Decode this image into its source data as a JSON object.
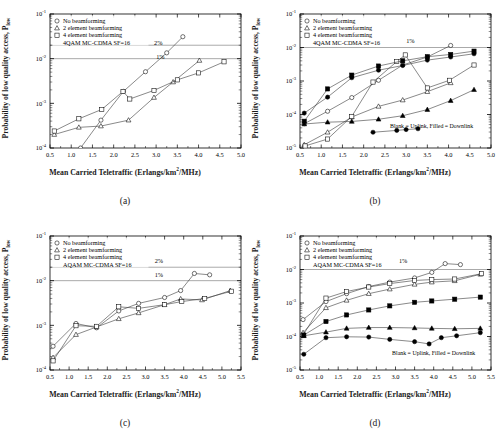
{
  "figure": {
    "panels": [
      {
        "id": "a",
        "caption": "(a)",
        "legend": {
          "items": [
            {
              "marker": "circle-open",
              "label": "No beamforming"
            },
            {
              "marker": "triangle-open",
              "label": "2 element beamforming"
            },
            {
              "marker": "square-open",
              "label": "4 element beamforming"
            }
          ],
          "note": "4QAM MC-CDMA SF=16"
        },
        "annotations": [
          {
            "text": "2%",
            "x": 3.05,
            "y": 0.02
          },
          {
            "text": "1%",
            "x": 3.1,
            "y": 0.01
          }
        ],
        "chart_data": {
          "type": "line",
          "title": "",
          "xlabel": "Mean Carried Teletraffic (Erlangs/km2/MHz)",
          "ylabel": "Probability of low quality access, Plow",
          "xlim": [
            0.5,
            5.0
          ],
          "ylim": [
            0.0001,
            0.1
          ],
          "yscale": "log",
          "xticks": [
            0.5,
            1.0,
            1.5,
            2.0,
            2.5,
            3.0,
            3.5,
            4.0,
            4.5,
            5.0
          ],
          "yticks": [
            0.0001,
            0.001,
            0.01,
            0.1
          ],
          "ytick_labels": [
            "10-4",
            "10-3",
            "10-2",
            "10-1"
          ],
          "grid": false,
          "hlines": [
            {
              "y": 0.02,
              "label": "2%"
            },
            {
              "y": 0.01,
              "label": "1%"
            }
          ],
          "series": [
            {
              "name": "No beamforming",
              "marker": "circle-open",
              "x": [
                1.22,
                1.7,
                2.23,
                2.75,
                3.25,
                3.63
              ],
              "y": [
                0.0001,
                0.00042,
                0.00185,
                0.0051,
                0.0135,
                0.031
              ]
            },
            {
              "name": "2 element beamforming",
              "marker": "triangle-open",
              "x": [
                0.6,
                1.18,
                1.7,
                2.35,
                2.95,
                3.4,
                4.02
              ],
              "y": [
                0.0002,
                0.00029,
                0.00031,
                0.00042,
                0.00135,
                0.003,
                0.0091
              ]
            },
            {
              "name": "4 element beamforming",
              "marker": "square-open",
              "x": [
                0.6,
                1.18,
                1.72,
                2.22,
                2.38,
                2.95,
                3.5,
                4.0,
                4.6
              ],
              "y": [
                0.00024,
                0.00045,
                0.00073,
                0.00185,
                0.00125,
                0.00195,
                0.00335,
                0.0048,
                0.0085
              ]
            }
          ]
        }
      },
      {
        "id": "b",
        "caption": "(b)",
        "legend": {
          "items": [
            {
              "marker": "circle-open",
              "label": "No beamforming"
            },
            {
              "marker": "triangle-open",
              "label": "2 element beamforming"
            },
            {
              "marker": "square-open",
              "label": "4 element beamforming"
            }
          ],
          "note": "4QAM MC-CDMA SF=16"
        },
        "annotations": [
          {
            "text": "1%",
            "x": 3.1,
            "y": 0.014
          },
          {
            "text": "Blank = Uplink, Filled = Downlink",
            "x": 3.6,
            "y": 4e-05
          }
        ],
        "chart_data": {
          "type": "line",
          "title": "",
          "xlabel": "Mean Carried Teletraffic (Erlangs/km2/MHz)",
          "ylabel": "Probability of low quality access, Plow",
          "xlim": [
            0.5,
            5.0
          ],
          "ylim": [
            1e-05,
            0.1
          ],
          "yscale": "log",
          "xticks": [
            0.5,
            1.0,
            1.5,
            2.0,
            2.5,
            3.0,
            3.5,
            4.0,
            4.5,
            5.0
          ],
          "yticks": [
            1e-05,
            0.0001,
            0.001,
            0.01,
            0.1
          ],
          "ytick_labels": [
            "10-5",
            "10-4",
            "10-3",
            "10-2",
            "10-1"
          ],
          "grid": false,
          "hlines": [
            {
              "y": 0.01,
              "label": "1%"
            }
          ],
          "series": [
            {
              "name": "No beamforming uplink",
              "marker": "circle-open",
              "x": [
                0.6,
                1.15,
                1.72,
                2.35,
                2.92,
                3.5,
                4.05
              ],
              "y": [
                5.3e-05,
                0.000125,
                0.00032,
                0.00105,
                0.003,
                0.0052,
                0.0115
              ]
            },
            {
              "name": "No beamforming downlink",
              "marker": "circle-filled",
              "x": [
                0.6,
                1.15,
                1.72,
                2.35,
                2.92,
                3.5,
                4.05,
                4.6
              ],
              "y": [
                0.00011,
                0.00033,
                0.00125,
                0.0021,
                0.0029,
                0.0042,
                0.0052,
                0.0065
              ]
            },
            {
              "name": "2 element uplink",
              "marker": "triangle-open",
              "x": [
                0.6,
                1.15,
                1.72,
                2.35,
                2.92,
                3.5,
                4.05
              ],
              "y": [
                1.25e-05,
                2.95e-05,
                8.4e-05,
                0.000175,
                0.00027,
                0.00048,
                0.00088
              ]
            },
            {
              "name": "2 element downlink",
              "marker": "triangle-filled",
              "x": [
                0.6,
                1.15,
                1.72,
                2.35,
                2.92,
                3.5,
                4.05,
                4.6
              ],
              "y": [
                5.2e-05,
                5.9e-05,
                6.2e-05,
                7.2e-05,
                9.2e-05,
                0.00014,
                0.00026,
                0.00055
              ]
            },
            {
              "name": "4 element uplink",
              "marker": "square-open",
              "x": [
                0.62,
                1.15,
                1.72,
                2.22,
                2.78,
                2.98,
                3.5,
                4.02,
                4.6
              ],
              "y": [
                1.15e-05,
                1.85e-05,
                8.8e-05,
                0.00093,
                0.0038,
                0.006,
                0.00062,
                0.00105,
                0.003
              ]
            },
            {
              "name": "4 element downlink",
              "marker": "square-filled",
              "x": [
                0.6,
                1.15,
                1.72,
                2.35,
                2.92,
                3.5,
                4.05,
                4.6
              ],
              "y": [
                6.3e-05,
                0.00058,
                0.0015,
                0.0028,
                0.004,
                0.0053,
                0.0062,
                0.0078
              ]
            },
            {
              "name": "low downlink",
              "marker": "circle-filled",
              "x": [
                2.22,
                2.78,
                3.0,
                3.28
              ],
              "y": [
                2.95e-05,
                3.35e-05,
                3.55e-05,
                3.75e-05
              ]
            }
          ]
        }
      },
      {
        "id": "c",
        "caption": "(c)",
        "legend": {
          "items": [
            {
              "marker": "circle-open",
              "label": "No beamforming"
            },
            {
              "marker": "triangle-open",
              "label": "2 element beamforming"
            },
            {
              "marker": "square-open",
              "label": "4 element beamforming"
            }
          ],
          "note": "AQAM MC-CDMA SF=16"
        },
        "annotations": [
          {
            "text": "2%",
            "x": 3.35,
            "y": 0.025
          },
          {
            "text": "1%",
            "x": 3.35,
            "y": 0.012
          }
        ],
        "chart_data": {
          "type": "line",
          "title": "",
          "xlabel": "Mean Carried Teletraffic (Erlangs/km2/MHz)",
          "ylabel": "Probability of low quality access, Plow",
          "xlim": [
            0.5,
            5.5
          ],
          "ylim": [
            0.0001,
            0.1
          ],
          "yscale": "log",
          "xticks": [
            0.5,
            1.0,
            1.5,
            2.0,
            2.5,
            3.0,
            3.5,
            4.0,
            4.5,
            5.0,
            5.5
          ],
          "yticks": [
            0.0001,
            0.001,
            0.01,
            0.1
          ],
          "ytick_labels": [
            "10-4",
            "10-3",
            "10-2",
            "10-1"
          ],
          "grid": false,
          "hlines": [
            {
              "y": 0.02,
              "label": "2%"
            },
            {
              "y": 0.01,
              "label": "1%"
            }
          ],
          "series": [
            {
              "name": "No beamforming",
              "marker": "circle-open",
              "x": [
                0.58,
                1.18,
                1.72,
                2.3,
                2.82,
                3.5,
                3.92,
                4.28,
                4.68
              ],
              "y": [
                0.00034,
                0.0011,
                0.00088,
                0.0021,
                0.0031,
                0.0042,
                0.006,
                0.0145,
                0.0135
              ]
            },
            {
              "name": "2 element beamforming",
              "marker": "triangle-open",
              "x": [
                0.58,
                1.18,
                1.72,
                2.3,
                2.82,
                3.5,
                3.92,
                4.48,
                5.22
              ],
              "y": [
                0.00019,
                0.00062,
                0.00092,
                0.0014,
                0.0019,
                0.0029,
                0.0039,
                0.0037,
                0.006
              ]
            },
            {
              "name": "4 element beamforming",
              "marker": "square-open",
              "x": [
                0.58,
                1.18,
                1.72,
                2.3,
                2.82,
                3.5,
                3.95,
                4.55,
                5.25
              ],
              "y": [
                0.00016,
                0.00098,
                0.00095,
                0.0026,
                0.0024,
                0.0029,
                0.0034,
                0.004,
                0.0058
              ]
            }
          ]
        }
      },
      {
        "id": "d",
        "caption": "(d)",
        "legend": {
          "items": [
            {
              "marker": "circle-open",
              "label": "No beamforming"
            },
            {
              "marker": "triangle-open",
              "label": "2 element beamforming"
            },
            {
              "marker": "square-open",
              "label": "4 element beamforming"
            }
          ],
          "note": "AQAM MC-CDMA SF=16"
        },
        "annotations": [
          {
            "text": "1%",
            "x": 3.2,
            "y": 0.016
          },
          {
            "text": "Blank = Uplink, Filled = Downlink",
            "x": 4.0,
            "y": 2.8e-05
          }
        ],
        "chart_data": {
          "type": "line",
          "title": "",
          "xlabel": "Mean Carried Teletraffic (Erlangs/km2/MHz)",
          "ylabel": "Probability of low quality access, Plow",
          "xlim": [
            0.5,
            5.5
          ],
          "ylim": [
            1e-05,
            0.1
          ],
          "yscale": "log",
          "xticks": [
            0.5,
            1.0,
            1.5,
            2.0,
            2.5,
            3.0,
            3.5,
            4.0,
            4.5,
            5.0,
            5.5
          ],
          "yticks": [
            1e-05,
            0.0001,
            0.001,
            0.01,
            0.1
          ],
          "ytick_labels": [
            "10-5",
            "10-4",
            "10-3",
            "10-2",
            "10-1"
          ],
          "grid": false,
          "hlines": [
            {
              "y": 0.01,
              "label": "1%"
            }
          ],
          "series": [
            {
              "name": "No beamforming uplink",
              "marker": "circle-open",
              "x": [
                0.58,
                1.18,
                1.72,
                2.3,
                2.85,
                3.5,
                3.95,
                4.3,
                4.7
              ],
              "y": [
                0.00032,
                0.0011,
                0.0019,
                0.0031,
                0.0042,
                0.0056,
                0.0082,
                0.015,
                0.014
              ]
            },
            {
              "name": "2 element uplink",
              "marker": "triangle-open",
              "x": [
                0.58,
                1.18,
                1.72,
                2.3,
                2.85,
                3.5,
                3.95,
                4.55,
                5.22
              ],
              "y": [
                0.00013,
                0.00072,
                0.0012,
                0.0019,
                0.0026,
                0.0036,
                0.0042,
                0.0046,
                0.0072
              ]
            },
            {
              "name": "4 element uplink",
              "marker": "square-open",
              "x": [
                0.58,
                1.18,
                1.72,
                2.3,
                2.85,
                3.5,
                3.95,
                4.55,
                5.25
              ],
              "y": [
                0.00011,
                0.0014,
                0.0022,
                0.003,
                0.0038,
                0.0047,
                0.005,
                0.0052,
                0.0075
              ]
            },
            {
              "name": "4 element downlink",
              "marker": "square-filled",
              "x": [
                0.6,
                1.18,
                1.72,
                2.3,
                2.85,
                3.5,
                3.95,
                4.55,
                5.22
              ],
              "y": [
                0.00011,
                0.00028,
                0.00044,
                0.00062,
                0.00082,
                0.00105,
                0.00115,
                0.0013,
                0.0015
              ]
            },
            {
              "name": "2 element downlink",
              "marker": "triangle-filled",
              "x": [
                0.6,
                1.18,
                1.72,
                2.3,
                2.85,
                3.5,
                3.95,
                4.55,
                5.22
              ],
              "y": [
                0.000105,
                0.000135,
                0.000175,
                0.000185,
                0.000185,
                0.00018,
                0.000175,
                0.00017,
                0.000175
              ]
            },
            {
              "name": "No beamforming downlink",
              "marker": "circle-filled",
              "x": [
                0.6,
                1.18,
                1.72,
                2.3,
                2.85,
                3.5,
                3.88,
                4.2,
                4.6,
                5.22
              ],
              "y": [
                2.95e-05,
                9.2e-05,
                9.8e-05,
                9.6e-05,
                8.2e-05,
                7e-05,
                6e-05,
                9.2e-05,
                0.000105,
                0.00013
              ]
            }
          ]
        }
      }
    ]
  }
}
